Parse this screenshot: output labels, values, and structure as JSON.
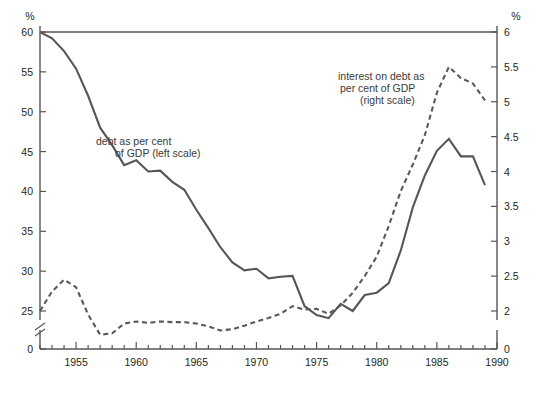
{
  "chart_data": {
    "type": "line",
    "title": "",
    "subtitle": "",
    "xlabel": "",
    "ylabel_left_unit": "%",
    "ylabel_right_unit": "%",
    "xlim": [
      1952,
      1990
    ],
    "x_major_ticks": [
      1955,
      1960,
      1965,
      1970,
      1975,
      1980,
      1985,
      1990
    ],
    "x_minor_tick_step": 1,
    "x_tick_labels": [
      "1955",
      "1960",
      "1965",
      "1970",
      "1975",
      "1980",
      "1985",
      "1990"
    ],
    "left_axis": {
      "ticks": [
        0,
        25,
        30,
        35,
        40,
        45,
        50,
        55,
        60
      ],
      "tick_labels": [
        "0",
        "25",
        "30",
        "35",
        "40",
        "45",
        "50",
        "55",
        "60"
      ],
      "ylim": [
        25,
        60
      ],
      "axis_break": true,
      "break_note": "scale break between 0 and 25",
      "unit": "%"
    },
    "right_axis": {
      "ticks": [
        0,
        2,
        2.5,
        3,
        3.5,
        4,
        4.5,
        5,
        5.5,
        6
      ],
      "tick_labels": [
        "0",
        "2",
        "2.5",
        "3",
        "3.5",
        "4",
        "4.5",
        "5",
        "5.5",
        "6"
      ],
      "ylim": [
        2,
        6
      ],
      "axis_break": true,
      "break_note": "scale break between 0 and 2",
      "unit": "%"
    },
    "grid": false,
    "legend_position": "inline annotations",
    "series": [
      {
        "name": "debt as per cent of GDP (left scale)",
        "axis": "left",
        "style": "solid",
        "color": "#565656",
        "annotation": "debt as per cent\nof GDP (left scale)",
        "x": [
          1952,
          1953,
          1954,
          1955,
          1956,
          1957,
          1958,
          1959,
          1960,
          1961,
          1962,
          1963,
          1964,
          1965,
          1966,
          1967,
          1968,
          1969,
          1970,
          1971,
          1972,
          1973,
          1974,
          1975,
          1976,
          1977,
          1978,
          1979,
          1980,
          1981,
          1982,
          1983,
          1984,
          1985,
          1986,
          1987,
          1988,
          1989
        ],
        "values": [
          60.0,
          59.2,
          57.6,
          55.4,
          52.0,
          48.0,
          45.8,
          43.3,
          43.9,
          42.5,
          42.6,
          41.2,
          40.2,
          37.7,
          35.4,
          33.0,
          31.1,
          30.1,
          30.3,
          29.1,
          29.3,
          29.4,
          25.6,
          24.5,
          24.1,
          25.9,
          25.0,
          27.0,
          27.3,
          28.5,
          32.6,
          38.0,
          42.0,
          45.1,
          46.6,
          44.4,
          44.4,
          40.8
        ]
      },
      {
        "name": "interest on debt as per cent of GDP (right scale)",
        "axis": "right",
        "style": "dashed",
        "color": "#5a5a5a",
        "annotation": "interest on debt as\nper cent of GDP\n(right scale)",
        "x": [
          1952,
          1953,
          1954,
          1955,
          1956,
          1957,
          1958,
          1959,
          1960,
          1961,
          1962,
          1963,
          1964,
          1965,
          1966,
          1967,
          1968,
          1969,
          1970,
          1971,
          1972,
          1973,
          1974,
          1975,
          1976,
          1977,
          1978,
          1979,
          1980,
          1981,
          1982,
          1983,
          1984,
          1985,
          1986,
          1987,
          1988,
          1989
        ],
        "values": [
          2.0,
          2.28,
          2.45,
          2.34,
          1.95,
          1.66,
          1.68,
          1.82,
          1.85,
          1.83,
          1.85,
          1.84,
          1.84,
          1.82,
          1.78,
          1.72,
          1.74,
          1.79,
          1.85,
          1.9,
          1.96,
          2.07,
          2.02,
          2.03,
          1.96,
          2.08,
          2.26,
          2.5,
          2.78,
          3.22,
          3.72,
          4.1,
          4.52,
          5.13,
          5.5,
          5.34,
          5.26,
          5.02
        ]
      }
    ],
    "annotations": [
      {
        "id": "debt-annotation",
        "line1": "debt as per cent",
        "line2": "of GDP (left scale)",
        "x": 96,
        "y": 141
      },
      {
        "id": "interest-annotation",
        "line1": "interest on debt as",
        "line2": "per cent of GDP",
        "line3": "(right scale)",
        "x": 338,
        "y": 74
      }
    ]
  },
  "axis_units": {
    "left": "%",
    "right": "%"
  }
}
